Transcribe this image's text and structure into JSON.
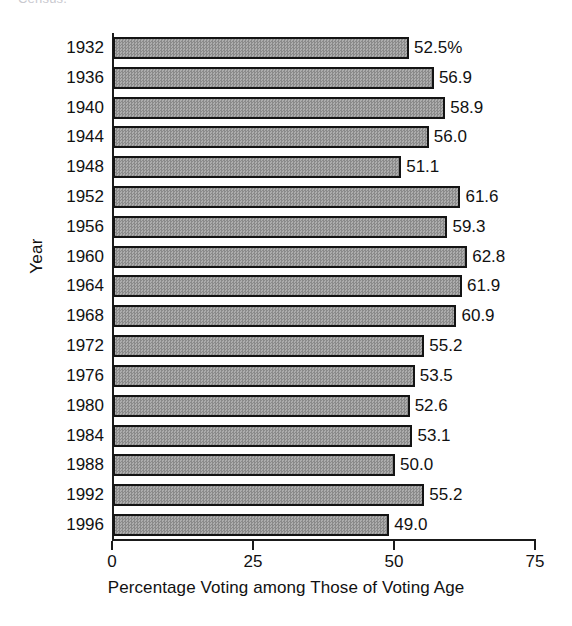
{
  "caption_remnant": "Census.",
  "chart_data": {
    "type": "bar",
    "orientation": "horizontal",
    "title": "",
    "xlabel": "Percentage Voting among Those of Voting Age",
    "ylabel": "Year",
    "xlim": [
      0,
      75
    ],
    "xticks": [
      0,
      25,
      50,
      75
    ],
    "xtick_labels": [
      "0",
      "25",
      "50",
      "75"
    ],
    "grid": false,
    "legend": "none",
    "bar_color": "#9a9a9a",
    "bar_edge_color": "#141414",
    "categories": [
      "1932",
      "1936",
      "1940",
      "1944",
      "1948",
      "1952",
      "1956",
      "1960",
      "1964",
      "1968",
      "1972",
      "1976",
      "1980",
      "1984",
      "1988",
      "1992",
      "1996"
    ],
    "values": [
      52.5,
      56.9,
      58.9,
      56.0,
      51.1,
      61.6,
      59.3,
      62.8,
      61.9,
      60.9,
      55.2,
      53.5,
      52.6,
      53.1,
      50.0,
      55.2,
      49.0
    ],
    "value_labels": [
      "52.5%",
      "56.9",
      "58.9",
      "56.0",
      "51.1",
      "61.6",
      "59.3",
      "62.8",
      "61.9",
      "60.9",
      "55.2",
      "53.5",
      "52.6",
      "53.1",
      "50.0",
      "55.2",
      "49.0"
    ]
  }
}
